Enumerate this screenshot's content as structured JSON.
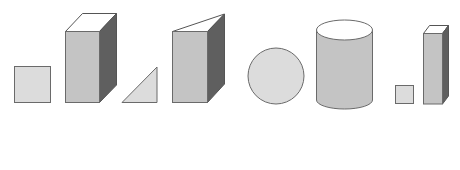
{
  "colors": {
    "face_light": "#dcdcdc",
    "face_front": "#c4c4c4",
    "face_side": "#5f5f5f",
    "outline": "#6a6a6a",
    "top_open": "#ffffff",
    "paren": "#8a8a8a"
  },
  "items": [
    {
      "id": 1,
      "flat_shape": "square",
      "solid": "square-prism (cuboid)",
      "answer_open": "(",
      "answer_close": ")",
      "answer_value": ""
    },
    {
      "id": 2,
      "flat_shape": "right-triangle",
      "solid": "triangular-prism",
      "answer_open": "(",
      "answer_close": ")",
      "answer_value": ""
    },
    {
      "id": 3,
      "flat_shape": "circle",
      "solid": "cylinder",
      "answer_open": "(",
      "answer_close": ")",
      "answer_value": ""
    },
    {
      "id": 4,
      "flat_shape": "small-square",
      "solid": "tall-square-prism",
      "answer_open": "(",
      "answer_close": ")",
      "answer_value": ""
    }
  ]
}
